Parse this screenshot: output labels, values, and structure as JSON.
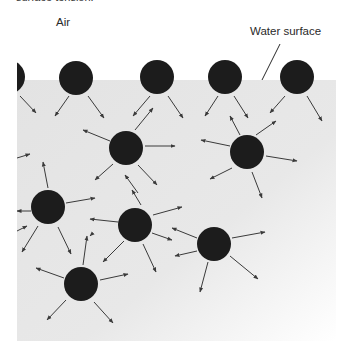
{
  "caption_fragment": "surface tension.",
  "labels": {
    "air": "Air",
    "water_surface": "Water surface"
  },
  "colors": {
    "water": "#e6e6e6",
    "molecule": "#1c1c1c",
    "arrow": "#3a3a3a",
    "background": "#ffffff"
  },
  "water_region": {
    "left": 17,
    "top": 80,
    "right": 336,
    "bottom": 341
  },
  "leader_line": {
    "x1": 280,
    "y1": 44,
    "x2": 262,
    "y2": 80
  },
  "molecule_radius": 17,
  "molecules": [
    {
      "id": "surface-1",
      "x": 8,
      "y": 77,
      "layer": "surface"
    },
    {
      "id": "surface-2",
      "x": 76,
      "y": 78,
      "layer": "surface"
    },
    {
      "id": "surface-3",
      "x": 157,
      "y": 77,
      "layer": "surface"
    },
    {
      "id": "surface-4",
      "x": 225,
      "y": 77,
      "layer": "surface"
    },
    {
      "id": "surface-5",
      "x": 297,
      "y": 77,
      "layer": "surface"
    },
    {
      "id": "bulk-1",
      "x": 126,
      "y": 148,
      "layer": "bulk"
    },
    {
      "id": "bulk-2",
      "x": 247,
      "y": 152,
      "layer": "bulk"
    },
    {
      "id": "bulk-3",
      "x": 48,
      "y": 207,
      "layer": "bulk"
    },
    {
      "id": "bulk-4",
      "x": 135,
      "y": 225,
      "layer": "bulk"
    },
    {
      "id": "bulk-5",
      "x": 214,
      "y": 244,
      "layer": "bulk"
    },
    {
      "id": "bulk-6",
      "x": 81,
      "y": 284,
      "layer": "bulk"
    }
  ],
  "arrows": [
    [
      20,
      96,
      36,
      113
    ],
    [
      69,
      96,
      55,
      116
    ],
    [
      88,
      96,
      104,
      118
    ],
    [
      150,
      96,
      133,
      116
    ],
    [
      168,
      96,
      183,
      118
    ],
    [
      218,
      96,
      205,
      116
    ],
    [
      234,
      96,
      248,
      118
    ],
    [
      285,
      96,
      270,
      113
    ],
    [
      307,
      96,
      322,
      121
    ],
    [
      135,
      130,
      153,
      108
    ],
    [
      110,
      141,
      83,
      130
    ],
    [
      145,
      146,
      175,
      146
    ],
    [
      113,
      164,
      95,
      180
    ],
    [
      138,
      165,
      157,
      185
    ],
    [
      138,
      193,
      125,
      175
    ],
    [
      17,
      158,
      30,
      154
    ],
    [
      256,
      135,
      276,
      121
    ],
    [
      240,
      135,
      230,
      116
    ],
    [
      230,
      146,
      201,
      140
    ],
    [
      266,
      156,
      297,
      161
    ],
    [
      232,
      168,
      210,
      179
    ],
    [
      252,
      172,
      262,
      198
    ],
    [
      48,
      188,
      43,
      162
    ],
    [
      66,
      203,
      95,
      198
    ],
    [
      31,
      211,
      17,
      211
    ],
    [
      38,
      226,
      22,
      252
    ],
    [
      58,
      227,
      71,
      254
    ],
    [
      118,
      222,
      90,
      219
    ],
    [
      153,
      215,
      182,
      207
    ],
    [
      152,
      233,
      172,
      240
    ],
    [
      124,
      241,
      103,
      262
    ],
    [
      143,
      244,
      156,
      272
    ],
    [
      141,
      205,
      132,
      190
    ],
    [
      197,
      238,
      172,
      228
    ],
    [
      232,
      238,
      265,
      232
    ],
    [
      197,
      251,
      175,
      256
    ],
    [
      208,
      262,
      200,
      292
    ],
    [
      230,
      256,
      258,
      279
    ],
    [
      83,
      265,
      87,
      236
    ],
    [
      64,
      278,
      36,
      268
    ],
    [
      100,
      280,
      128,
      274
    ],
    [
      66,
      300,
      47,
      320
    ],
    [
      94,
      302,
      113,
      323
    ],
    [
      92,
      234,
      90,
      236
    ],
    [
      17,
      231,
      27,
      226
    ]
  ]
}
